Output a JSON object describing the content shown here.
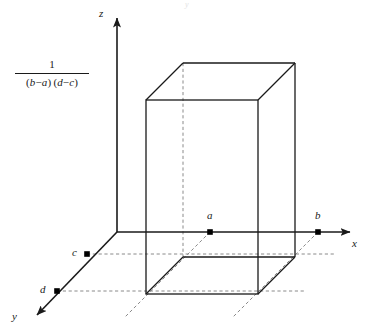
{
  "figure": {
    "width": 371,
    "height": 332,
    "background": "#ffffff",
    "stroke_color": "#1a1a1a",
    "dashed_color": "#8a8a8a",
    "point_color": "#000000"
  },
  "density": {
    "numerator": "1",
    "denominator_factor_1_open": "(",
    "denominator_factor_1": "b",
    "denominator_op_1": "−",
    "denominator_factor_1b": "a",
    "denominator_factor_1_close": ")",
    "denominator_factor_2_open": "(",
    "denominator_factor_2": "d",
    "denominator_op_2": "−",
    "denominator_factor_2b": "c",
    "denominator_factor_2_close": ")",
    "full_text": "1 / (b − a)(d − c)"
  },
  "axes": {
    "z_label": "z",
    "x_label": "x",
    "y_label": "y",
    "origin": {
      "x": 117,
      "y": 232
    },
    "z_tip": {
      "x": 117,
      "y": 12
    },
    "x_tip": {
      "x": 356,
      "y": 232
    },
    "y_tip": {
      "x": 31,
      "y": 321
    }
  },
  "points": [
    {
      "name": "a",
      "label": "a",
      "axis": "x",
      "x": 210,
      "y": 232,
      "label_x": 207,
      "label_y": 211
    },
    {
      "name": "b",
      "label": "b",
      "axis": "x",
      "x": 318,
      "y": 232,
      "label_x": 315,
      "label_y": 211
    },
    {
      "name": "c",
      "label": "c",
      "axis": "y",
      "x": 87,
      "y": 254,
      "label_x": 73,
      "label_y": 249
    },
    {
      "name": "d",
      "label": "d",
      "axis": "y",
      "x": 57,
      "y": 291,
      "label_x": 41,
      "label_y": 286
    }
  ],
  "box": {
    "front": {
      "left": 146,
      "right": 258,
      "top": 100,
      "bottom": 294
    },
    "back": {
      "left": 183,
      "right": 295,
      "top": 63,
      "bottom": 257
    }
  },
  "artifact": {
    "text": "y"
  }
}
